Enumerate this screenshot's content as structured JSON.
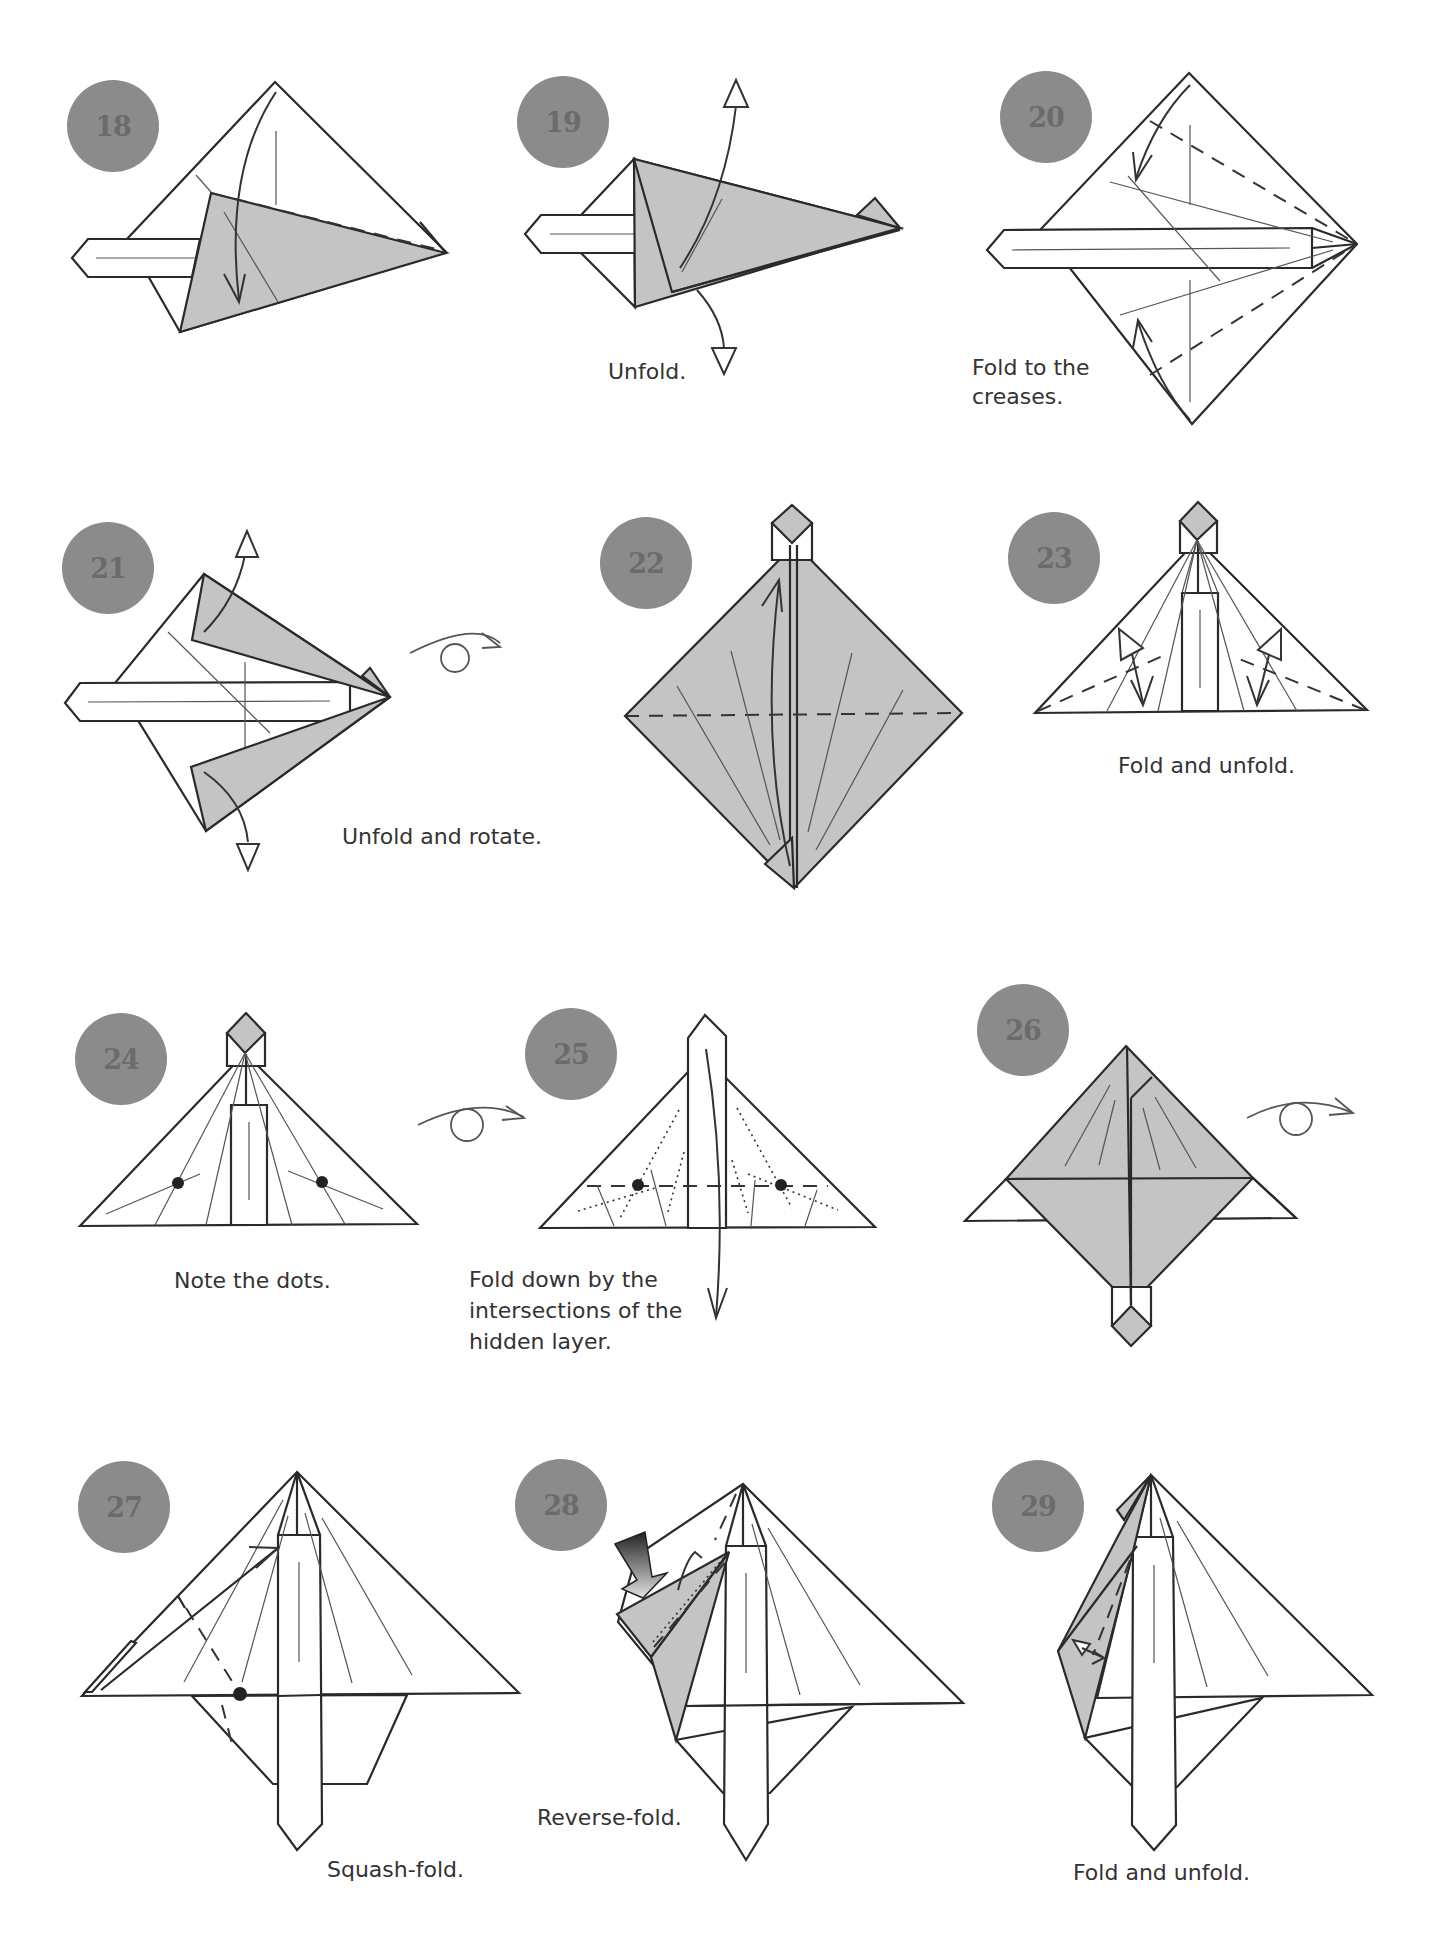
{
  "page": {
    "badge_color": "#8b8b8b",
    "shade_color": "#c4c4c4",
    "steps": [
      {
        "number": "18",
        "caption": ""
      },
      {
        "number": "19",
        "caption": "Unfold."
      },
      {
        "number": "20",
        "caption_lines": [
          "Fold to the",
          "creases."
        ]
      },
      {
        "number": "21",
        "caption": "Unfold and rotate."
      },
      {
        "number": "22",
        "caption": ""
      },
      {
        "number": "23",
        "caption": "Fold and unfold."
      },
      {
        "number": "24",
        "caption": "Note the dots."
      },
      {
        "number": "25",
        "caption_lines": [
          "Fold down by the",
          "intersections of the",
          "hidden layer."
        ]
      },
      {
        "number": "26",
        "caption": ""
      },
      {
        "number": "27",
        "caption": "Squash-fold."
      },
      {
        "number": "28",
        "caption": "Reverse-fold."
      },
      {
        "number": "29",
        "caption": "Fold and unfold."
      }
    ],
    "symbols": {
      "turn_over": "turn-over-icon",
      "valley_fold_arrow": "fold-arrow-icon",
      "unfold_arrow": "unfold-arrow-icon",
      "push_arrow": "push-arrow-icon"
    }
  }
}
